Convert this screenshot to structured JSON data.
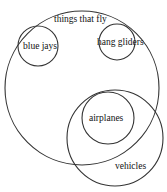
{
  "diagram": {
    "type": "venn",
    "sets": [
      {
        "id": "things-that-fly",
        "label": "things that fly"
      },
      {
        "id": "blue-jays",
        "label": "blue jays"
      },
      {
        "id": "hang-gliders",
        "label": "hang gliders"
      },
      {
        "id": "vehicles",
        "label": "vehicles"
      },
      {
        "id": "airplanes",
        "label": "airplanes"
      }
    ],
    "colors": {
      "stroke": "#333333",
      "text": "#111111",
      "background": "#ffffff"
    }
  }
}
